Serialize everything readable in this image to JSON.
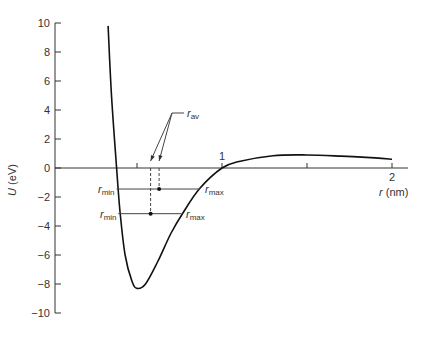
{
  "chart_data": {
    "type": "line",
    "title": "",
    "xlabel": "r (nm)",
    "ylabel": "U (eV)",
    "xlim": [
      0,
      2.1
    ],
    "ylim": [
      -10,
      10
    ],
    "x_ticks": [
      0.5,
      1,
      1.5,
      2
    ],
    "x_tick_labels": [
      "",
      "1",
      "",
      "2"
    ],
    "y_ticks": [
      10,
      8,
      6,
      4,
      2,
      0,
      -2,
      -4,
      -6,
      -8,
      -10
    ],
    "y_tick_labels": [
      "10",
      "8",
      "6",
      "4",
      "2",
      "0",
      "−2",
      "−4",
      "−6",
      "−8",
      "−10"
    ],
    "grid": false,
    "series": [
      {
        "name": "potential energy curve",
        "x": [
          0.33,
          0.35,
          0.38,
          0.4,
          0.43,
          0.47,
          0.5,
          0.55,
          0.62,
          0.7,
          0.77,
          0.87,
          1.0,
          1.1,
          1.3,
          1.5,
          1.7,
          1.9,
          2.0
        ],
        "y": [
          9.8,
          5.0,
          0.0,
          -3.0,
          -6.0,
          -7.8,
          -8.3,
          -8.0,
          -6.5,
          -4.5,
          -3.1,
          -1.4,
          0.0,
          0.45,
          0.85,
          0.9,
          0.82,
          0.7,
          0.6
        ]
      }
    ],
    "annotations": [
      {
        "type": "hline",
        "y": -1.45,
        "x_from": 0.38,
        "x_to": 0.87,
        "left_label": "r_min",
        "right_label": "r_max"
      },
      {
        "type": "hline",
        "y": -3.15,
        "x_from": 0.39,
        "x_to": 0.76,
        "left_label": "r_min",
        "right_label": "r_max"
      },
      {
        "type": "point",
        "x": 0.63,
        "y": -1.45,
        "dashed_to_axis": true
      },
      {
        "type": "point",
        "x": 0.58,
        "y": -3.15,
        "dashed_to_axis": true
      },
      {
        "type": "arrow_label",
        "label": "r_av",
        "points_to": [
          0.58,
          0.63
        ]
      }
    ]
  },
  "labels": {
    "y_axis_main": "U",
    "y_axis_unit": " (eV)",
    "x_axis_main": "r",
    "x_axis_unit": " (nm)",
    "r": "r",
    "min": "min",
    "max": "max",
    "av": "av"
  }
}
